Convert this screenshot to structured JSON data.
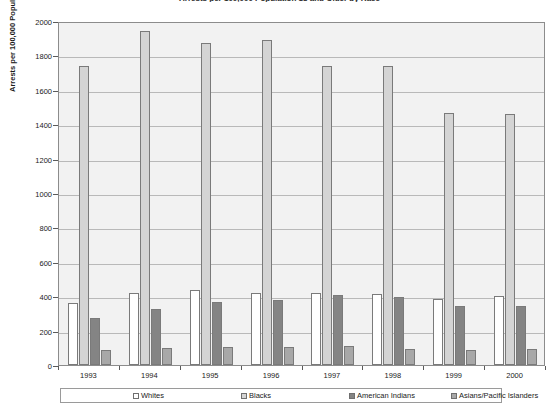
{
  "chart_data": {
    "type": "bar",
    "title": "Arrests per 100,000 Population 18 and Older by Race",
    "xlabel": "",
    "ylabel": "Arrests per 100,000 Population 18 and Older",
    "categories": [
      "1993",
      "1994",
      "1995",
      "1996",
      "1997",
      "1998",
      "1999",
      "2000"
    ],
    "series": [
      {
        "name": "Whites",
        "color": "#ffffff",
        "values": [
          360,
          420,
          435,
          420,
          420,
          415,
          385,
          400
        ]
      },
      {
        "name": "Blacks",
        "color": "#d4d4d4",
        "values": [
          1740,
          1940,
          1870,
          1890,
          1740,
          1740,
          1465,
          1460
        ]
      },
      {
        "name": "American Indians",
        "color": "#848484",
        "values": [
          275,
          325,
          365,
          380,
          405,
          395,
          345,
          345
        ]
      },
      {
        "name": "Asians/Pacific Islanders",
        "color": "#a8a8a8",
        "values": [
          85,
          100,
          105,
          105,
          110,
          95,
          85,
          95
        ]
      }
    ],
    "ylim": [
      0,
      2000
    ],
    "yticks": [
      0,
      200,
      400,
      600,
      800,
      1000,
      1200,
      1400,
      1600,
      1800,
      2000
    ],
    "grid": true,
    "legend_position": "bottom",
    "plot_background": "#f2f2f2",
    "gridline_color": "#b9b9b9",
    "axis_color": "#5a5a5a"
  }
}
